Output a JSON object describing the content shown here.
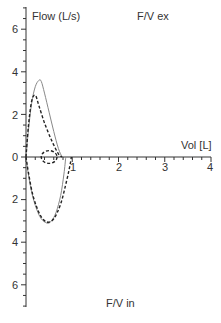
{
  "chart_data": {
    "type": "line",
    "ylabel": "Flow (L/s)",
    "xlabel": "Vol [L]",
    "annotations": [
      "F/V ex",
      "F/V in"
    ],
    "xlim": [
      0,
      4
    ],
    "ylim": [
      -7,
      7
    ],
    "x_ticks": [
      "1",
      "2",
      "3",
      "4"
    ],
    "y_ticks_upper": [
      "6",
      "4",
      "2",
      "0"
    ],
    "y_ticks_lower": [
      "2",
      "4",
      "6"
    ],
    "grid": false,
    "legend": null,
    "series": [
      {
        "name": "measured expiratory (solid)",
        "style": "solid",
        "color": "#888888",
        "x": [
          0.0,
          0.05,
          0.12,
          0.2,
          0.28,
          0.33,
          0.4,
          0.5,
          0.6,
          0.7,
          0.78
        ],
        "y": [
          0.0,
          1.2,
          2.5,
          3.3,
          3.6,
          3.55,
          3.0,
          2.1,
          1.2,
          0.4,
          0.0
        ]
      },
      {
        "name": "measured inspiratory (solid)",
        "style": "solid",
        "color": "#888888",
        "x": [
          0.0,
          0.05,
          0.15,
          0.3,
          0.45,
          0.55,
          0.65,
          0.75,
          0.82,
          0.86
        ],
        "y": [
          0.0,
          -0.8,
          -1.9,
          -2.8,
          -3.1,
          -3.0,
          -2.6,
          -1.8,
          -0.8,
          0.0
        ]
      },
      {
        "name": "predicted expiratory (dashed)",
        "style": "dashed",
        "color": "#222222",
        "x": [
          0.0,
          0.05,
          0.12,
          0.2,
          0.28,
          0.4,
          0.55,
          0.7,
          0.78
        ],
        "y": [
          0.0,
          1.4,
          2.6,
          2.9,
          2.4,
          1.6,
          0.8,
          0.15,
          0.0
        ]
      },
      {
        "name": "predicted inspiratory (dashed)",
        "style": "dashed",
        "color": "#222222",
        "x": [
          0.0,
          0.05,
          0.15,
          0.3,
          0.45,
          0.6,
          0.75,
          0.88,
          0.95,
          0.98
        ],
        "y": [
          0.0,
          -0.7,
          -1.8,
          -2.7,
          -3.05,
          -2.9,
          -2.2,
          -1.1,
          -0.4,
          0.0
        ]
      },
      {
        "name": "tidal loop (dashed)",
        "style": "dashed",
        "color": "#222222",
        "center": [
          0.5,
          0.0
        ],
        "rx": 0.17,
        "ry": 0.3
      }
    ]
  },
  "labels": {
    "y_axis": "Flow (L/s)",
    "x_axis": "Vol [L]",
    "top_annotation": "F/V ex",
    "bottom_annotation": "F/V in"
  }
}
